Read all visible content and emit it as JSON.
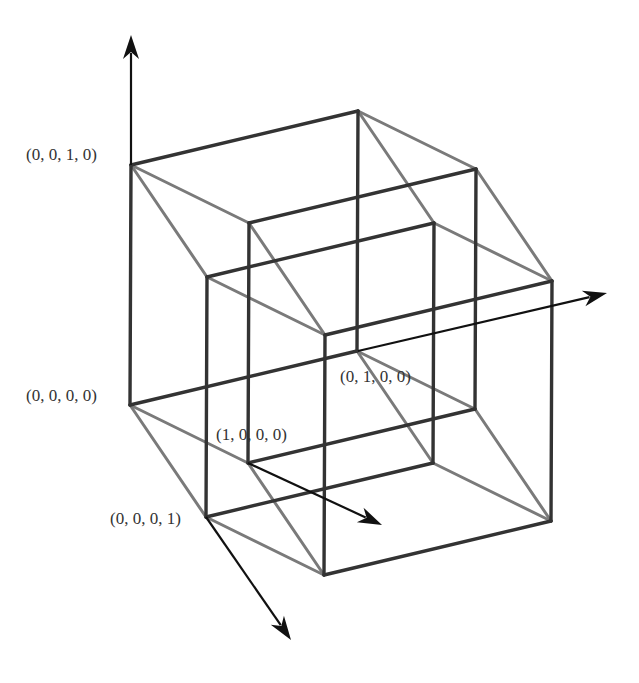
{
  "diagram": {
    "colors": {
      "dark_edge": "#333333",
      "light_edge": "#7a7a7a",
      "axis": "#111111",
      "label": "#333333",
      "background": "#ffffff"
    },
    "origin": [
      130,
      405
    ],
    "basis": {
      "x": [
        118,
        58
      ],
      "y": [
        227,
        -54
      ],
      "z": [
        1,
        -240
      ],
      "w": [
        76,
        112
      ]
    },
    "labels": [
      {
        "text": "(0, 0, 1, 0)",
        "x": 26,
        "y": 160
      },
      {
        "text": "(0, 0, 0, 0)",
        "x": 26,
        "y": 401
      },
      {
        "text": "(1, 0, 0, 0)",
        "x": 216,
        "y": 440
      },
      {
        "text": "(0, 1, 0, 0)",
        "x": 340,
        "y": 382
      },
      {
        "text": "(0, 0, 0, 1)",
        "x": 110,
        "y": 524
      }
    ],
    "axes": [
      {
        "name": "z-axis",
        "from": [
          131,
          165
        ],
        "to": [
          131,
          35
        ]
      },
      {
        "name": "y-axis",
        "from": [
          358,
          351
        ],
        "to": [
          607,
          293
        ]
      },
      {
        "name": "x-axis",
        "from": [
          248,
          463
        ],
        "to": [
          382,
          525
        ]
      },
      {
        "name": "w-axis",
        "from": [
          206,
          517
        ],
        "to": [
          291,
          640
        ]
      }
    ]
  }
}
